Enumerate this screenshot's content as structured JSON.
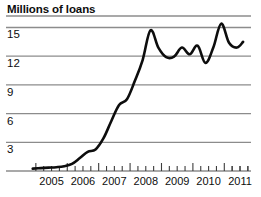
{
  "chart_data": {
    "type": "line",
    "title": "Millions of loans",
    "subtitle": "",
    "xlabel": "",
    "ylabel": "",
    "ylim": [
      0,
      16.2
    ],
    "xlim": [
      2004.75,
      2011.85
    ],
    "grid": true,
    "legend": false,
    "y_ticks": [
      3,
      6,
      9,
      12,
      15
    ],
    "y_tick_labels": [
      "3",
      "6",
      "9",
      "12",
      "15"
    ],
    "x_ticks": [
      2005,
      2006,
      2007,
      2008,
      2009,
      2010,
      2011
    ],
    "x_tick_labels": [
      "2005",
      "2006",
      "2007",
      "2008",
      "2009",
      "2010",
      "2011"
    ],
    "minor_x_ticks_per_year": 4,
    "series": [
      {
        "name": "Loans",
        "x": [
          2004.9,
          2005.15,
          2005.4,
          2005.65,
          2005.9,
          2006.15,
          2006.4,
          2006.65,
          2006.9,
          2007.15,
          2007.4,
          2007.65,
          2007.9,
          2008.15,
          2008.4,
          2008.65,
          2008.9,
          2009.15,
          2009.4,
          2009.65,
          2009.9,
          2010.15,
          2010.4,
          2010.65,
          2010.9,
          2011.15,
          2011.4,
          2011.6
        ],
        "values": [
          0.25,
          0.3,
          0.35,
          0.4,
          0.5,
          0.75,
          1.35,
          2.0,
          2.25,
          3.4,
          5.2,
          6.9,
          7.5,
          9.4,
          11.6,
          14.7,
          12.9,
          11.9,
          11.95,
          12.9,
          12.2,
          13.1,
          11.3,
          12.9,
          15.4,
          13.4,
          12.9,
          13.5
        ]
      }
    ],
    "line_color": "#0d0d0d",
    "gridline_color": "#8c8c8c",
    "axis_color": "#8c8c8c",
    "background_color": "#ffffff"
  }
}
